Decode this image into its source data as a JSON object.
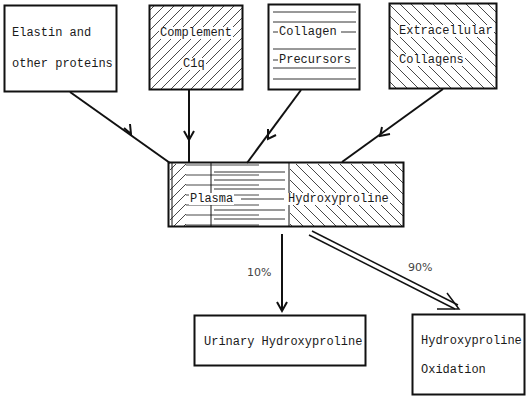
{
  "diagram": {
    "sources": [
      {
        "id": "elastin",
        "lines": [
          "Elastin and",
          "other proteins"
        ],
        "pattern": "none"
      },
      {
        "id": "complement",
        "lines": [
          "Complement",
          "C1q"
        ],
        "pattern": "forward-hatch"
      },
      {
        "id": "collagen-precursors",
        "lines": [
          "Collagen",
          "Precursors"
        ],
        "pattern": "horizontal-lines"
      },
      {
        "id": "extracellular-collagens",
        "lines": [
          "Extracellular",
          "Collagens"
        ],
        "pattern": "back-hatch"
      }
    ],
    "pool": {
      "id": "plasma-hydroxyproline",
      "label_left": "Plasma",
      "label_right": "Hydroxyproline",
      "segments": [
        "forward-hatch",
        "horizontal-lines",
        "back-hatch"
      ]
    },
    "outputs": [
      {
        "id": "urinary",
        "lines": [
          "Urinary Hydroxyproline"
        ],
        "percent": "10%",
        "arrow": "single"
      },
      {
        "id": "oxidation",
        "lines": [
          "Hydroxyproline",
          "Oxidation"
        ],
        "percent": "90%",
        "arrow": "double"
      }
    ],
    "edges": [
      {
        "from": "elastin",
        "to": "plasma-hydroxyproline"
      },
      {
        "from": "complement",
        "to": "plasma-hydroxyproline"
      },
      {
        "from": "collagen-precursors",
        "to": "plasma-hydroxyproline"
      },
      {
        "from": "extracellular-collagens",
        "to": "plasma-hydroxyproline"
      },
      {
        "from": "plasma-hydroxyproline",
        "to": "urinary",
        "label": "10%"
      },
      {
        "from": "plasma-hydroxyproline",
        "to": "oxidation",
        "label": "90%"
      }
    ]
  }
}
